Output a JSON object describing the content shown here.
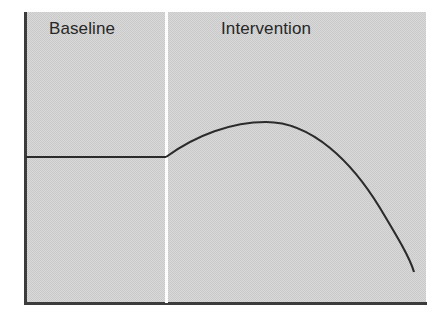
{
  "figure": {
    "kind": "single-case-design-graph",
    "width": 440,
    "height": 326,
    "background_color": "#ffffff",
    "panel_color": "#c9c9c9",
    "line_color": "#2b2b2b",
    "axis_color": "#3c3c3c",
    "divider_color": "#ffffff",
    "text_color": "#272727"
  },
  "phases": {
    "baseline_label": "Baseline",
    "intervention_label": "Intervention"
  },
  "chart_data": {
    "type": "line",
    "title": "",
    "subtitle": "",
    "xlabel": "",
    "ylabel": "",
    "xlim": [
      0,
      100
    ],
    "ylim": [
      0,
      100
    ],
    "grid": false,
    "legend": false,
    "legend_position": "none",
    "axis_ticks": {
      "x": [],
      "y": []
    },
    "annotations": [
      {
        "text": "Baseline",
        "x": 6,
        "y": 96,
        "role": "phase-label"
      },
      {
        "text": "Intervention",
        "x": 49,
        "y": 96,
        "role": "phase-label"
      },
      {
        "text": "",
        "x": 35,
        "y": 50,
        "role": "phase-change-line"
      }
    ],
    "phase_change_x": 35,
    "series": [
      {
        "name": "Baseline",
        "phase": "baseline",
        "style": "flat-stable",
        "x": [
          0,
          5,
          10,
          15,
          20,
          25,
          30,
          35
        ],
        "y": [
          50,
          50,
          50,
          50,
          50,
          50,
          50,
          50
        ]
      },
      {
        "name": "Intervention",
        "phase": "intervention",
        "style": "rise-peak-then-sharp-decline",
        "x": [
          35,
          40,
          45,
          50,
          55,
          60,
          65,
          70,
          75,
          80,
          85,
          90,
          95,
          97,
          98
        ],
        "y": [
          50,
          62,
          70,
          75,
          78,
          80,
          81,
          80,
          78,
          74,
          68,
          58,
          42,
          25,
          11
        ]
      }
    ],
    "path_geometry": {
      "baseline_segment": "M 26 157 L 166 157",
      "intervention_segment": "M 166 157 C 196 135, 232 122, 266 122 C 312 122, 352 162, 380 208 C 398 238, 410 258, 414 272"
    }
  }
}
